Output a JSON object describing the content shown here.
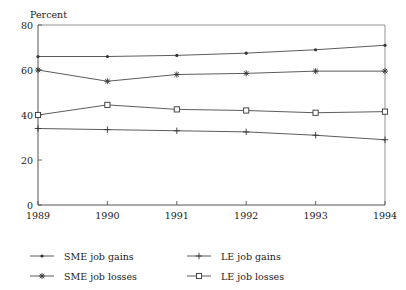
{
  "chart_data": {
    "type": "line",
    "title": "",
    "ylabel": "Percent",
    "xlabel": "",
    "x": [
      1989,
      1990,
      1991,
      1992,
      1993,
      1994
    ],
    "xticklabels": [
      "1989",
      "1990",
      "1991",
      "1992",
      "1993",
      "1994"
    ],
    "yticklabels": [
      "0",
      "20",
      "40",
      "60",
      "80"
    ],
    "yticks": [
      0,
      20,
      40,
      60,
      80
    ],
    "ylim": [
      0,
      80
    ],
    "xlim": [
      1989,
      1994
    ],
    "grid": false,
    "legend_position": "below-plot",
    "series": [
      {
        "name": "SME job gains",
        "marker": "dot",
        "values": [
          66.0,
          66.0,
          66.5,
          67.5,
          69.0,
          71.0
        ]
      },
      {
        "name": "SME job losses",
        "marker": "asterisk",
        "values": [
          60.0,
          55.0,
          58.0,
          58.5,
          59.5,
          59.5
        ]
      },
      {
        "name": "LE job gains",
        "marker": "plus",
        "values": [
          34.0,
          33.5,
          33.0,
          32.5,
          31.0,
          29.0
        ]
      },
      {
        "name": "LE job losses",
        "marker": "square",
        "values": [
          40.0,
          44.5,
          42.5,
          42.0,
          41.0,
          41.5
        ]
      }
    ]
  },
  "legend": {
    "entries": [
      {
        "label": "SME job gains",
        "marker": "dot"
      },
      {
        "label": "LE job gains",
        "marker": "plus"
      },
      {
        "label": "SME job losses",
        "marker": "asterisk"
      },
      {
        "label": "LE job losses",
        "marker": "square"
      }
    ]
  },
  "colors": {
    "line": "#4a4a4a",
    "marker": "#333333",
    "axis": "#555555",
    "frame": "#777777",
    "text": "#1a1a1a",
    "background": "#ffffff"
  }
}
